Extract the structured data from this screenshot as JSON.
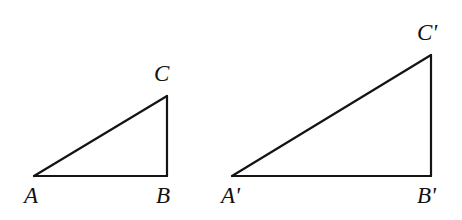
{
  "figure": {
    "kind": "geometry-diagram",
    "background_color": "#ffffff",
    "stroke_color": "#141414",
    "stroke_width": 2,
    "width": 462,
    "height": 220
  },
  "triangles": [
    {
      "name": "triangle-ABC",
      "vertices": [
        {
          "id": "A",
          "label": "A",
          "x": 34,
          "y": 176
        },
        {
          "id": "B",
          "label": "B",
          "x": 167,
          "y": 176
        },
        {
          "id": "C",
          "label": "C",
          "x": 167,
          "y": 96
        }
      ],
      "edges": [
        {
          "name": "edge-AB",
          "from": "A",
          "to": "B"
        },
        {
          "name": "edge-BC",
          "from": "B",
          "to": "C"
        },
        {
          "name": "edge-CA",
          "from": "C",
          "to": "A"
        }
      ],
      "right_angle_at": "B",
      "leg_horizontal": 133,
      "leg_vertical": 80
    },
    {
      "name": "triangle-A-prime-B-prime-C-prime",
      "vertices": [
        {
          "id": "Ap",
          "label": "A'",
          "x": 232,
          "y": 176
        },
        {
          "id": "Bp",
          "label": "B'",
          "x": 431,
          "y": 176
        },
        {
          "id": "Cp",
          "label": "C'",
          "x": 431,
          "y": 55
        }
      ],
      "edges": [
        {
          "name": "edge-ApBp",
          "from": "Ap",
          "to": "Bp"
        },
        {
          "name": "edge-BpCp",
          "from": "Bp",
          "to": "Cp"
        },
        {
          "name": "edge-CpAp",
          "from": "Cp",
          "to": "Ap"
        }
      ],
      "right_angle_at": "Bp",
      "leg_horizontal": 199,
      "leg_vertical": 121
    }
  ],
  "labels": {
    "A": "A",
    "B": "B",
    "C": "C",
    "A_prime": "A'",
    "B_prime": "B'",
    "C_prime": "C'"
  }
}
